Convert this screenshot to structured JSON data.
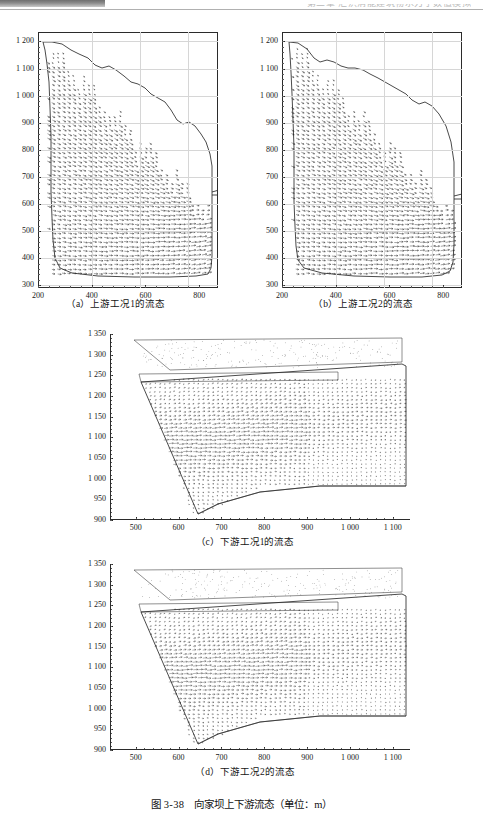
{
  "document": {
    "type": "scanned-book-page",
    "header_text": "第三章 泄洪消能建筑物水力学数值模拟",
    "figure_title_number": "图 3-38",
    "figure_title_text": "向家坝上下游流态（单位：m）"
  },
  "figure": {
    "caption_number": "图 3-38",
    "caption_text": "向家坝上下游流态（单位：m）",
    "panels": [
      {
        "key": "a",
        "caption": "（a）上游工况1的流态"
      },
      {
        "key": "b",
        "caption": "（b）上游工况2的流态"
      },
      {
        "key": "c",
        "caption": "（c）下游工况1的流态"
      },
      {
        "key": "d",
        "caption": "（d）下游工况2的流态"
      }
    ]
  },
  "chart_data": [
    {
      "id": "panel-a",
      "type": "scatter",
      "title": "（a）上游工况1的流态",
      "plot_kind": "quiver-vector-field",
      "xlabel": "",
      "ylabel": "",
      "unit": "m",
      "xlim": [
        200,
        870
      ],
      "ylim": [
        290,
        1235
      ],
      "xticks": [
        200,
        400,
        600,
        800
      ],
      "xtick_labels": [
        "200",
        "400",
        "600",
        "800"
      ],
      "yticks": [
        300,
        400,
        500,
        600,
        700,
        800,
        900,
        1000,
        1100,
        1200
      ],
      "ytick_labels": [
        "300",
        "400",
        "500",
        "600",
        "700",
        "800",
        "900",
        "1 000",
        "1 100",
        "1 200"
      ],
      "grid": true,
      "legend": "none",
      "annotations": [
        "upstream reservoir flow field, condition 1"
      ]
    },
    {
      "id": "panel-b",
      "type": "scatter",
      "title": "（b）上游工况2的流态",
      "plot_kind": "quiver-vector-field",
      "xlabel": "",
      "ylabel": "",
      "unit": "m",
      "xlim": [
        200,
        870
      ],
      "ylim": [
        290,
        1235
      ],
      "xticks": [
        200,
        400,
        600,
        800
      ],
      "xtick_labels": [
        "200",
        "400",
        "600",
        "800"
      ],
      "yticks": [
        300,
        400,
        500,
        600,
        700,
        800,
        900,
        1000,
        1100,
        1200
      ],
      "ytick_labels": [
        "300",
        "400",
        "500",
        "600",
        "700",
        "800",
        "900",
        "1 000",
        "1 100",
        "1 200"
      ],
      "grid": true,
      "legend": "none",
      "annotations": [
        "upstream reservoir flow field, condition 2"
      ]
    },
    {
      "id": "panel-c",
      "type": "scatter",
      "title": "（c）下游工况1的流态",
      "plot_kind": "quiver-vector-field",
      "xlabel": "",
      "ylabel": "",
      "unit": "m",
      "xlim": [
        440,
        1140
      ],
      "ylim": [
        900,
        1350
      ],
      "xticks": [
        500,
        600,
        700,
        800,
        900,
        1000,
        1100
      ],
      "xtick_labels": [
        "500",
        "600",
        "700",
        "800",
        "900",
        "1 000",
        "1 100"
      ],
      "yticks": [
        900,
        950,
        1000,
        1050,
        1100,
        1150,
        1200,
        1250,
        1300,
        1350
      ],
      "ytick_labels": [
        "900",
        "950",
        "1 000",
        "1 050",
        "1 100",
        "1 150",
        "1 200",
        "1 250",
        "1 300",
        "1 350"
      ],
      "grid": false,
      "legend": "none",
      "annotations": [
        "downstream channel flow field, condition 1"
      ]
    },
    {
      "id": "panel-d",
      "type": "scatter",
      "title": "（d）下游工况2的流态",
      "plot_kind": "quiver-vector-field",
      "xlabel": "",
      "ylabel": "",
      "unit": "m",
      "xlim": [
        440,
        1140
      ],
      "ylim": [
        900,
        1350
      ],
      "xticks": [
        500,
        600,
        700,
        800,
        900,
        1000,
        1100
      ],
      "xtick_labels": [
        "500",
        "600",
        "700",
        "800",
        "900",
        "1 000",
        "1 100"
      ],
      "yticks": [
        900,
        950,
        1000,
        1050,
        1100,
        1150,
        1200,
        1250,
        1300,
        1350
      ],
      "ytick_labels": [
        "900",
        "950",
        "1 000",
        "1 050",
        "1 100",
        "1 150",
        "1 200",
        "1 250",
        "1 300",
        "1 350"
      ],
      "grid": false,
      "legend": "none",
      "annotations": [
        "downstream channel flow field, condition 2"
      ]
    }
  ]
}
